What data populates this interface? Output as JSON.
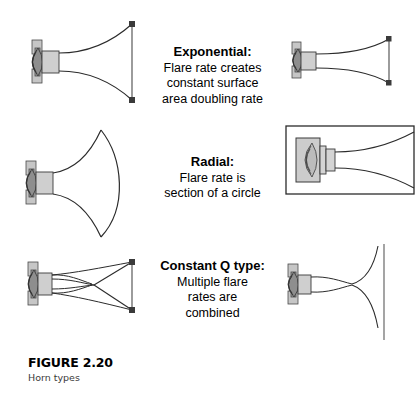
{
  "figure": {
    "caption_title": "FIGURE 2.20",
    "caption_subtitle": "Horn types",
    "background_color": "#ffffff",
    "line_color": "#2b2b2b",
    "driver_fill": "#b9b9b9",
    "mouth_cap_color": "#3a3a3a"
  },
  "rows": [
    {
      "id": "exponential",
      "title": "Exponential:",
      "lines": [
        "Flare rate creates",
        "constant surface",
        "area doubling rate"
      ],
      "left_drawing": "exponential-horn-side-view-large",
      "right_drawing": "exponential-horn-side-view-small"
    },
    {
      "id": "radial",
      "title": "Radial:",
      "lines": [
        "Flare rate is",
        "section of a circle"
      ],
      "left_drawing": "radial-horn-side-view-large",
      "right_drawing": "radial-horn-top-view-boxed"
    },
    {
      "id": "constant-q",
      "title": "Constant Q type:",
      "lines": [
        "Multiple flare",
        "rates are",
        "combined"
      ],
      "left_drawing": "constant-q-horn-side-view-large",
      "right_drawing": "constant-q-horn-side-view-small"
    }
  ]
}
